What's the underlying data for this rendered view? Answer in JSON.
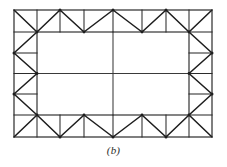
{
  "figure": {
    "caption": "(b)",
    "colors": {
      "background": "#ffffff",
      "chord": "#2b2b2b",
      "diagonal": "#1e1e1e",
      "interior": "#3a3a3a",
      "caption": "#2b2b2b"
    },
    "geometry": {
      "outer": {
        "x1": 14,
        "y1": 10,
        "x2": 212,
        "y2": 137
      },
      "inner": {
        "x1": 37,
        "y1": 32,
        "x2": 189,
        "y2": 115
      },
      "mid_vertical_x": 113,
      "mid_horizontal_y": 73.5,
      "top_chord_panel_x": [
        14,
        37,
        60,
        84,
        113,
        142,
        166,
        189,
        212
      ],
      "bottom_chord_panel_x": [
        14,
        37,
        60,
        84,
        113,
        142,
        166,
        189,
        212
      ],
      "left_chord_panel_y": [
        10,
        32,
        53,
        73.5,
        94,
        115,
        137
      ],
      "right_chord_panel_y": [
        10,
        32,
        53,
        73.5,
        94,
        115,
        137
      ]
    },
    "members": {
      "top_truss_label": "top perimeter truss",
      "bottom_truss_label": "bottom perimeter truss",
      "left_truss_label": "left perimeter truss",
      "right_truss_label": "right perimeter truss",
      "interior_beam_horizontal_label": "interior horizontal beam",
      "interior_beam_vertical_label": "interior vertical beam"
    }
  }
}
